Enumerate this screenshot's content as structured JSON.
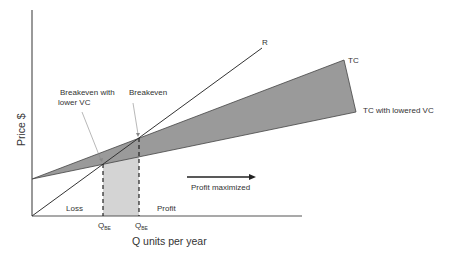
{
  "axes": {
    "x_label": "Q units per year",
    "y_label": "Price $"
  },
  "lines": {
    "revenue": {
      "label": "R"
    },
    "total_cost": {
      "label": "TC"
    },
    "total_cost_lowered": {
      "label": "TC with lowered VC"
    }
  },
  "annotations": {
    "breakeven_lower_vc_line1": "Breakeven with",
    "breakeven_lower_vc_line2": "lower VC",
    "breakeven": "Breakeven",
    "profit_maximized": "Profit maximized",
    "loss": "Loss",
    "profit": "Profit"
  },
  "ticks": [
    {
      "main": "Q",
      "sub": "BE"
    },
    {
      "main": "Q",
      "sub": "BE"
    }
  ],
  "colors": {
    "axis": "#555555",
    "line": "#333333",
    "tc_wedge_fill": "#9a9a9a",
    "profit_band_fill": "#d4d4d4",
    "text": "#333333"
  }
}
